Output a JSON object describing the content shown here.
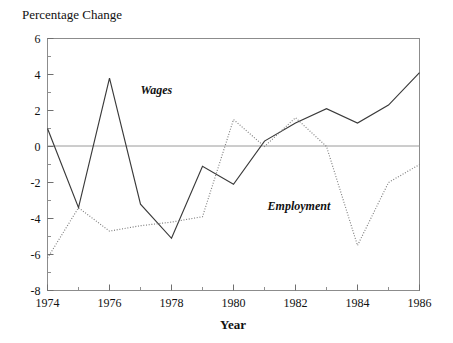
{
  "chart_data": {
    "type": "line",
    "title": "",
    "xlabel": "Year",
    "ylabel": "Percentage Change",
    "ylim": [
      -8,
      6
    ],
    "xlim": [
      1974,
      1986
    ],
    "grid": false,
    "legend_position": "inline-annotations",
    "y_ticks": [
      6,
      4,
      2,
      0,
      -2,
      -4,
      -6,
      -8
    ],
    "y_tick_labels": [
      "6",
      "4",
      "2",
      "0",
      "-2",
      "-4",
      "-6",
      "-8"
    ],
    "y_minor_ticks": [
      5,
      3,
      1,
      -1,
      -3,
      -5,
      -7
    ],
    "x_ticks": [
      1974,
      1976,
      1978,
      1980,
      1982,
      1984,
      1986
    ],
    "x_tick_labels": [
      "1974",
      "1976",
      "1978",
      "1980",
      "1982",
      "1984",
      "1986"
    ],
    "x_minor_ticks": [
      1975,
      1977,
      1979,
      1981,
      1983,
      1985
    ],
    "x": [
      1974,
      1975,
      1976,
      1977,
      1978,
      1979,
      1980,
      1981,
      1982,
      1983,
      1984,
      1985,
      1986
    ],
    "series": [
      {
        "name": "Wages",
        "style": "solid",
        "color": "#3a3a3a",
        "label_x": 1977.0,
        "label_y": 2.9,
        "values": [
          1.0,
          -3.4,
          3.8,
          -3.2,
          -5.1,
          -1.1,
          -2.1,
          0.3,
          1.3,
          2.1,
          1.3,
          2.3,
          4.1
        ]
      },
      {
        "name": "Employment",
        "style": "dotted",
        "color": "#7d7d7d",
        "label_x": 1981.1,
        "label_y": -3.5,
        "values": [
          -6.2,
          -3.4,
          -4.7,
          -4.4,
          -4.2,
          -3.9,
          1.5,
          0.0,
          1.6,
          0.0,
          -5.5,
          -2.0,
          -1.0
        ]
      }
    ],
    "annotations": [
      {
        "text": "Wages",
        "x": 1977.0,
        "y": 2.9
      },
      {
        "text": "Employment",
        "x": 1981.1,
        "y": -3.5
      }
    ],
    "colors": {
      "background": "#ffffff",
      "frame": "#8c8c8c",
      "zero_line": "#9a9a9a",
      "text": "#111111"
    }
  }
}
